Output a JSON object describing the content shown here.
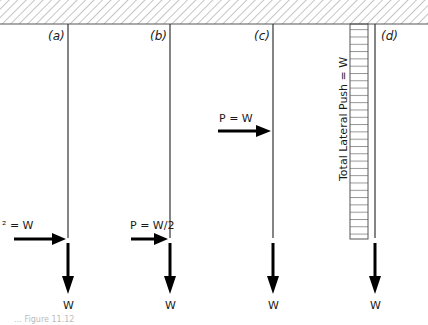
{
  "diagram": {
    "ceiling": {
      "style": "hatched",
      "color": "#9a9a9a"
    },
    "cases": [
      {
        "id": "a",
        "label": "(a)",
        "force_label": "P = W",
        "force_visible_text": "² = W",
        "force_position": "bottom",
        "weight_label": "W"
      },
      {
        "id": "b",
        "label": "(b)",
        "force_label": "P = W/2",
        "force_position": "bottom",
        "weight_label": "W"
      },
      {
        "id": "c",
        "label": "(c)",
        "force_label": "P = W",
        "force_position": "upper",
        "weight_label": "W"
      },
      {
        "id": "d",
        "label": "(d)",
        "distributed_load_label": "Total Lateral Push = W",
        "weight_label": "W"
      }
    ],
    "caption": "… Figure 11.12"
  }
}
